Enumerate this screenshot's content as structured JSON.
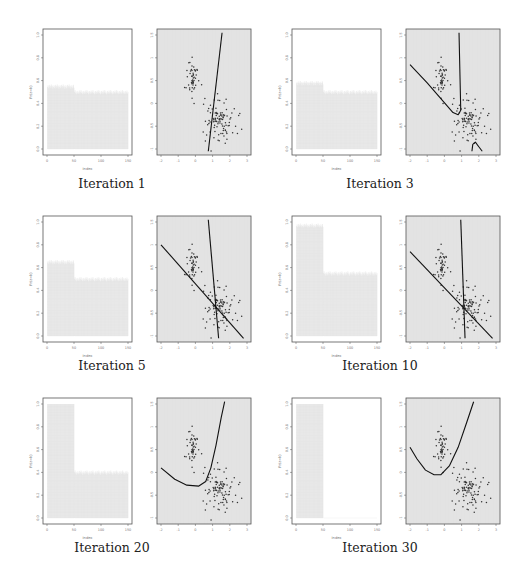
{
  "chart_data": [
    {
      "iteration": 1,
      "caption": "Iteration 1",
      "prob_plot": {
        "type": "bar",
        "xlabel": "Index",
        "ylabel": "Pr(z=k)",
        "xlim": [
          0,
          150
        ],
        "ylim": [
          0,
          1.0
        ],
        "x_ticks": [
          "0",
          "50",
          "100",
          "150"
        ],
        "y_ticks": [
          "0.0",
          "0.2",
          "0.4",
          "0.6",
          "0.8",
          "1.0"
        ],
        "segments": [
          {
            "from": 1,
            "to": 50,
            "value": 0.55
          },
          {
            "from": 51,
            "to": 150,
            "value": 0.5
          }
        ]
      },
      "scatter_plot": {
        "type": "scatter",
        "xlim": [
          -2,
          3
        ],
        "ylim": [
          -1,
          1.5
        ],
        "x_ticks": [
          "-2",
          "-1",
          "0",
          "1",
          "2",
          "3"
        ],
        "y_ticks": [
          "-1",
          "-0.5",
          "0",
          "0.5",
          "1",
          "1.5"
        ],
        "boundary": [
          [
            [
              0.75,
              -1.05
            ],
            [
              1.55,
              1.55
            ]
          ]
        ]
      }
    },
    {
      "iteration": 3,
      "caption": "Iteration 3",
      "prob_plot": {
        "type": "bar",
        "xlabel": "Index",
        "ylabel": "Pr(z=k)",
        "xlim": [
          0,
          150
        ],
        "ylim": [
          0,
          1.0
        ],
        "x_ticks": [
          "0",
          "50",
          "100",
          "150"
        ],
        "y_ticks": [
          "0.0",
          "0.2",
          "0.4",
          "0.6",
          "0.8",
          "1.0"
        ],
        "segments": [
          {
            "from": 1,
            "to": 50,
            "value": 0.58
          },
          {
            "from": 51,
            "to": 150,
            "value": 0.5
          }
        ]
      },
      "scatter_plot": {
        "type": "scatter",
        "xlim": [
          -2,
          3
        ],
        "ylim": [
          -1,
          1.5
        ],
        "x_ticks": [
          "-2",
          "-1",
          "0",
          "1",
          "2",
          "3"
        ],
        "y_ticks": [
          "-1",
          "-0.5",
          "0",
          "0.5",
          "1",
          "1.5"
        ],
        "boundary": [
          [
            [
              -2.0,
              0.85
            ],
            [
              -1.0,
              0.45
            ],
            [
              0.5,
              -0.2
            ],
            [
              0.8,
              -0.25
            ],
            [
              0.95,
              -0.15
            ],
            [
              0.85,
              1.55
            ]
          ],
          [
            [
              1.6,
              -1.05
            ],
            [
              1.65,
              -0.9
            ],
            [
              1.8,
              -0.85
            ],
            [
              2.0,
              -0.95
            ],
            [
              2.2,
              -1.05
            ]
          ]
        ]
      }
    },
    {
      "iteration": 5,
      "caption": "Iteration 5",
      "prob_plot": {
        "type": "bar",
        "xlabel": "Index",
        "ylabel": "Pr(z=k)",
        "xlim": [
          0,
          150
        ],
        "ylim": [
          0,
          1.0
        ],
        "x_ticks": [
          "0",
          "50",
          "100",
          "150"
        ],
        "y_ticks": [
          "0.0",
          "0.2",
          "0.4",
          "0.6",
          "0.8",
          "1.0"
        ],
        "segments": [
          {
            "from": 1,
            "to": 50,
            "value": 0.65
          },
          {
            "from": 51,
            "to": 150,
            "value": 0.5
          }
        ]
      },
      "scatter_plot": {
        "type": "scatter",
        "xlim": [
          -2,
          3
        ],
        "ylim": [
          -1,
          1.5
        ],
        "x_ticks": [
          "-2",
          "-1",
          "0",
          "1",
          "2",
          "3"
        ],
        "y_ticks": [
          "-1",
          "-0.5",
          "0",
          "0.5",
          "1",
          "1.5"
        ],
        "boundary": [
          [
            [
              -2.0,
              1.0
            ],
            [
              2.8,
              -1.05
            ]
          ],
          [
            [
              0.75,
              1.55
            ],
            [
              1.35,
              -1.05
            ]
          ]
        ]
      }
    },
    {
      "iteration": 10,
      "caption": "Iteration 10",
      "prob_plot": {
        "type": "bar",
        "xlabel": "Index",
        "ylabel": "Pr(z=k)",
        "xlim": [
          0,
          150
        ],
        "ylim": [
          0,
          1.0
        ],
        "x_ticks": [
          "0",
          "50",
          "100",
          "150"
        ],
        "y_ticks": [
          "0.0",
          "0.2",
          "0.4",
          "0.6",
          "0.8",
          "1.0"
        ],
        "segments": [
          {
            "from": 1,
            "to": 50,
            "value": 0.97
          },
          {
            "from": 51,
            "to": 150,
            "value": 0.55
          }
        ]
      },
      "scatter_plot": {
        "type": "scatter",
        "xlim": [
          -2,
          3
        ],
        "ylim": [
          -1,
          1.5
        ],
        "x_ticks": [
          "-2",
          "-1",
          "0",
          "1",
          "2",
          "3"
        ],
        "y_ticks": [
          "-1",
          "-0.5",
          "0",
          "0.5",
          "1",
          "1.5"
        ],
        "boundary": [
          [
            [
              -2.0,
              0.85
            ],
            [
              2.8,
              -1.05
            ]
          ],
          [
            [
              0.95,
              1.55
            ],
            [
              1.2,
              -1.05
            ]
          ]
        ]
      }
    },
    {
      "iteration": 20,
      "caption": "Iteration 20",
      "prob_plot": {
        "type": "bar",
        "xlabel": "Index",
        "ylabel": "Pr(z=k)",
        "xlim": [
          0,
          150
        ],
        "ylim": [
          0,
          1.0
        ],
        "x_ticks": [
          "0",
          "50",
          "100",
          "150"
        ],
        "y_ticks": [
          "0.0",
          "0.2",
          "0.4",
          "0.6",
          "0.8",
          "1.0"
        ],
        "segments": [
          {
            "from": 1,
            "to": 50,
            "value": 1.0
          },
          {
            "from": 51,
            "to": 150,
            "value": 0.4
          }
        ]
      },
      "scatter_plot": {
        "type": "scatter",
        "xlim": [
          -2,
          3
        ],
        "ylim": [
          -1,
          1.5
        ],
        "x_ticks": [
          "-2",
          "-1",
          "0",
          "1",
          "2",
          "3"
        ],
        "y_ticks": [
          "-1",
          "-0.5",
          "0",
          "0.5",
          "1",
          "1.5"
        ],
        "boundary": [
          [
            [
              -2.0,
              0.1
            ],
            [
              -1.2,
              -0.15
            ],
            [
              -0.5,
              -0.28
            ],
            [
              0.2,
              -0.3
            ],
            [
              0.6,
              -0.2
            ],
            [
              0.9,
              0.1
            ],
            [
              1.2,
              0.6
            ],
            [
              1.5,
              1.2
            ],
            [
              1.7,
              1.55
            ]
          ]
        ]
      }
    },
    {
      "iteration": 30,
      "caption": "Iteration 30",
      "prob_plot": {
        "type": "bar",
        "xlabel": "Index",
        "ylabel": "Pr(z=k)",
        "xlim": [
          0,
          150
        ],
        "ylim": [
          0,
          1.0
        ],
        "x_ticks": [
          "0",
          "50",
          "100",
          "150"
        ],
        "y_ticks": [
          "0.0",
          "0.2",
          "0.4",
          "0.6",
          "0.8",
          "1.0"
        ],
        "segments": [
          {
            "from": 1,
            "to": 50,
            "value": 1.0
          },
          {
            "from": 51,
            "to": 150,
            "value": 0.0
          }
        ]
      },
      "scatter_plot": {
        "type": "scatter",
        "xlim": [
          -2,
          3
        ],
        "ylim": [
          -1,
          1.5
        ],
        "x_ticks": [
          "-2",
          "-1",
          "0",
          "1",
          "2",
          "3"
        ],
        "y_ticks": [
          "-1",
          "-0.5",
          "0",
          "0.5",
          "1",
          "1.5"
        ],
        "boundary": [
          [
            [
              -2.0,
              0.55
            ],
            [
              -1.6,
              0.3
            ],
            [
              -1.1,
              0.05
            ],
            [
              -0.6,
              -0.05
            ],
            [
              -0.2,
              -0.05
            ],
            [
              0.3,
              0.15
            ],
            [
              0.8,
              0.55
            ],
            [
              1.3,
              1.1
            ],
            [
              1.7,
              1.55
            ]
          ]
        ]
      }
    }
  ],
  "colors": {
    "prob_fill": "#dcdcdc",
    "scatter_bg": "#e6e6e6",
    "points": "#333333",
    "boundary": "#111111",
    "frame": "#555555"
  }
}
